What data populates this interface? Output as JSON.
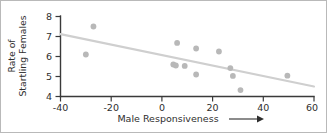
{
  "chart_data": {
    "type": "scatter",
    "title": "",
    "xlabel": "Male Responsiveness",
    "ylabel_line1": "Rate of",
    "ylabel_line2": "Startling Females",
    "xlabel_arrow": "arrow-right",
    "xlim": [
      -40,
      60
    ],
    "ylim": [
      4,
      8
    ],
    "xticks": [
      -40,
      -20,
      0,
      20,
      40,
      60
    ],
    "xtick_labels": [
      "-40",
      "-20",
      "0",
      "20",
      "40",
      "60"
    ],
    "yticks": [
      4,
      5,
      6,
      7,
      8
    ],
    "ytick_labels": [
      "4",
      "5",
      "6",
      "7",
      "8"
    ],
    "grid": false,
    "legend": "none",
    "point_color": "#b8b8b8",
    "trendline_color": "#cfcfcf",
    "axis_color": "#3a3a3a",
    "frame_color": "#b9b9b9",
    "points": [
      {
        "x": -30,
        "y": 6.1
      },
      {
        "x": -27,
        "y": 7.5
      },
      {
        "x": 4.5,
        "y": 5.6
      },
      {
        "x": 5.5,
        "y": 5.55
      },
      {
        "x": 6,
        "y": 6.68
      },
      {
        "x": 9,
        "y": 5.53
      },
      {
        "x": 13.5,
        "y": 6.4
      },
      {
        "x": 13.5,
        "y": 5.1
      },
      {
        "x": 22.5,
        "y": 6.25
      },
      {
        "x": 27,
        "y": 5.42
      },
      {
        "x": 28,
        "y": 5.03
      },
      {
        "x": 31,
        "y": 4.32
      },
      {
        "x": 49.5,
        "y": 5.04
      }
    ],
    "trendline": {
      "x1": -40,
      "y1": 7.12,
      "x2": 60,
      "y2": 4.5
    }
  }
}
